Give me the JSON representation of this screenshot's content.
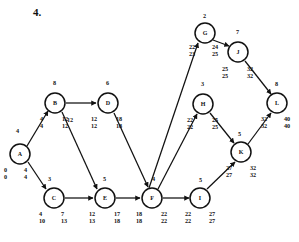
{
  "page": {
    "question_number": "4.",
    "background": "#ffffff",
    "ink": "#111111"
  },
  "diagram": {
    "type": "network-diagram",
    "node_radius": 10,
    "nodes": [
      {
        "id": "A",
        "label": "A",
        "cx": 20,
        "cy": 154,
        "early": "0",
        "early2": "0",
        "late": "4",
        "late2": "4",
        "left_x": 4,
        "left_y": 167,
        "right_x": 24,
        "right_y": 167
      },
      {
        "id": "B",
        "label": "B",
        "cx": 55,
        "cy": 103,
        "early": "4",
        "early2": "4",
        "late": "12",
        "late2": "12",
        "left_x": 40,
        "left_y": 116,
        "right_x": 62,
        "right_y": 116
      },
      {
        "id": "C",
        "label": "C",
        "cx": 54,
        "cy": 198,
        "early": "4",
        "early2": "10",
        "late": "7",
        "late2": "13",
        "left_x": 39,
        "left_y": 211,
        "right_x": 61,
        "right_y": 211
      },
      {
        "id": "D",
        "label": "D",
        "cx": 108,
        "cy": 103,
        "early": "12",
        "early2": "12",
        "late": "18",
        "late2": "18",
        "left_x": 91,
        "left_y": 116,
        "right_x": 116,
        "right_y": 116
      },
      {
        "id": "E",
        "label": "E",
        "cx": 105,
        "cy": 198,
        "early": "12",
        "early2": "13",
        "late": "17",
        "late2": "18",
        "left_x": 89,
        "left_y": 211,
        "right_x": 114,
        "right_y": 211
      },
      {
        "id": "F",
        "label": "F",
        "cx": 152,
        "cy": 198,
        "early": "18",
        "early2": "18",
        "late": "22",
        "late2": "22",
        "left_x": 136,
        "left_y": 211,
        "right_x": 161,
        "right_y": 211
      },
      {
        "id": "G",
        "label": "G",
        "cx": 205,
        "cy": 33,
        "early": "22",
        "early2": "23",
        "late": "24",
        "late2": "25",
        "left_x": 189,
        "left_y": 44,
        "right_x": 212,
        "right_y": 44
      },
      {
        "id": "H",
        "label": "H",
        "cx": 203,
        "cy": 104,
        "early": "22",
        "early2": "22",
        "late": "25",
        "late2": "25",
        "left_x": 187,
        "left_y": 117,
        "right_x": 212,
        "right_y": 117
      },
      {
        "id": "I",
        "label": "I",
        "cx": 200,
        "cy": 198,
        "early": "22",
        "early2": "22",
        "late": "27",
        "late2": "27",
        "left_x": 185,
        "left_y": 211,
        "right_x": 209,
        "right_y": 211
      },
      {
        "id": "J",
        "label": "J",
        "cx": 238,
        "cy": 52,
        "early": "25",
        "early2": "25",
        "late": "32",
        "late2": "32",
        "left_x": 222,
        "left_y": 66,
        "right_x": 247,
        "right_y": 66
      },
      {
        "id": "K",
        "label": "K",
        "cx": 241,
        "cy": 152,
        "early": "27",
        "early2": "27",
        "late": "32",
        "late2": "32",
        "left_x": 226,
        "left_y": 165,
        "right_x": 250,
        "right_y": 165
      },
      {
        "id": "L",
        "label": "L",
        "cx": 277,
        "cy": 103,
        "early": "32",
        "early2": "32",
        "late": "40",
        "late2": "40",
        "left_x": 261,
        "left_y": 116,
        "right_x": 284,
        "right_y": 116
      }
    ],
    "edges": [
      {
        "from": "A",
        "to": "B",
        "weight": "4",
        "lx": 16,
        "ly": 128
      },
      {
        "from": "A",
        "to": "C",
        "weight": "3",
        "lx": 48,
        "ly": 176
      },
      {
        "from": "B",
        "to": "D",
        "weight": "8",
        "lx": 53,
        "ly": 80
      },
      {
        "from": "B",
        "to": "E",
        "weight": "12",
        "lx": 67,
        "ly": 117
      },
      {
        "from": "C",
        "to": "E",
        "weight": "5",
        "lx": 103,
        "ly": 176
      },
      {
        "from": "D",
        "to": "F",
        "weight": "6",
        "lx": 106,
        "ly": 80
      },
      {
        "from": "E",
        "to": "F",
        "weight": "4",
        "lx": 152,
        "ly": 176
      },
      {
        "from": "F",
        "to": "G",
        "weight": "2",
        "lx": 203,
        "ly": 13
      },
      {
        "from": "F",
        "to": "H",
        "weight": "3",
        "lx": 201,
        "ly": 81
      },
      {
        "from": "F",
        "to": "I",
        "weight": "5",
        "lx": 199,
        "ly": 177
      },
      {
        "from": "G",
        "to": "J",
        "weight": "7",
        "lx": 236,
        "ly": 29
      },
      {
        "from": "H",
        "to": "K",
        "weight": "5",
        "lx": 238,
        "ly": 131
      },
      {
        "from": "I",
        "to": "K",
        "weight": "8",
        "lx": 275,
        "ly": 81
      },
      {
        "from": "J",
        "to": "L",
        "weight": "",
        "lx": 0,
        "ly": 0
      },
      {
        "from": "K",
        "to": "L",
        "weight": "",
        "lx": 0,
        "ly": 0
      }
    ]
  }
}
